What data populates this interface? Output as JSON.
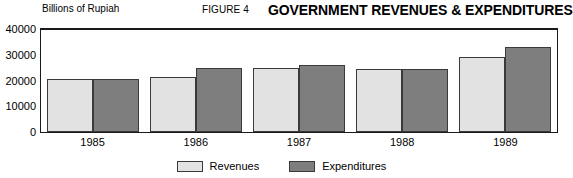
{
  "header": {
    "figure_number": "FIGURE 4",
    "title": "GOVERNMENT REVENUES & EXPENDITURES",
    "unit_label": "Billions of Rupiah"
  },
  "legend": {
    "items": [
      {
        "label": "Revenues",
        "color": "#e2e2e2",
        "swatch_name": "legend-swatch-revenues"
      },
      {
        "label": "Expenditures",
        "color": "#7e7e7e",
        "swatch_name": "legend-swatch-expenditures"
      }
    ]
  },
  "axis": {
    "y_ticks": [
      "0",
      "10000",
      "20000",
      "30000",
      "40000"
    ],
    "x_ticks": [
      "1985",
      "1986",
      "1987",
      "1988",
      "1989"
    ]
  },
  "chart_data": {
    "type": "bar",
    "title": "GOVERNMENT REVENUES & EXPENDITURES",
    "subtitle": "FIGURE 4",
    "xlabel": "",
    "ylabel": "Billions of Rupiah",
    "ylim": [
      0,
      40000
    ],
    "yticks": [
      0,
      10000,
      20000,
      30000,
      40000
    ],
    "grid": false,
    "legend_position": "bottom-center",
    "categories": [
      "1985",
      "1986",
      "1987",
      "1988",
      "1989"
    ],
    "series": [
      {
        "name": "Revenues",
        "color": "#e2e2e2",
        "values": [
          20400,
          21500,
          24800,
          24300,
          29300
        ]
      },
      {
        "name": "Expenditures",
        "color": "#7e7e7e",
        "values": [
          20700,
          24800,
          26000,
          24300,
          33000
        ]
      }
    ]
  }
}
